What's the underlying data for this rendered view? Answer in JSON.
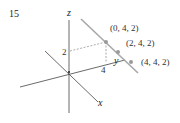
{
  "problem_number": "15",
  "axes": {
    "x_label": "x",
    "y_label": "y",
    "z_label": "z"
  },
  "ticks": {
    "z_tick": "2",
    "y_tick": "4"
  },
  "points": [
    {
      "label": "(0, 4, 2)"
    },
    {
      "label": "(2, 4, 2)"
    },
    {
      "label": "(4, 4, 2)"
    }
  ],
  "colors": {
    "axis": "#333333",
    "line": "#a8a8a8",
    "point": "#9a9a9a",
    "dashed": "#888888"
  }
}
